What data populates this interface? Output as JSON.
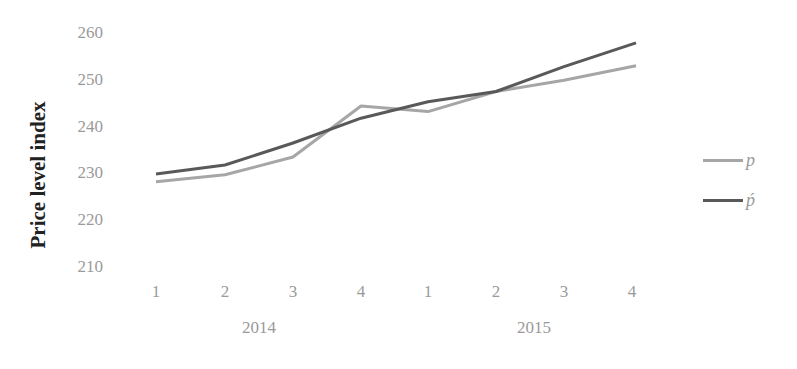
{
  "chart_data": {
    "type": "line",
    "title": "",
    "xlabel": "",
    "ylabel": "Price level index",
    "ylim": [
      210,
      260
    ],
    "yticks": [
      210,
      220,
      230,
      240,
      250,
      260
    ],
    "grid": false,
    "legend_position": "right",
    "categories": [
      "1",
      "2",
      "3",
      "4",
      "1",
      "2",
      "3",
      "4"
    ],
    "category_groups": [
      {
        "label": "2014",
        "quarters": [
          "1",
          "2",
          "3",
          "4"
        ]
      },
      {
        "label": "2015",
        "quarters": [
          "1",
          "2",
          "3",
          "4"
        ]
      }
    ],
    "series": [
      {
        "name": "p",
        "color": "#a6a6a6",
        "values": [
          228.2,
          229.7,
          233.5,
          244.4,
          243.2,
          247.5,
          249.9,
          253.0
        ]
      },
      {
        "name": "ṕ",
        "color": "#595959",
        "values": [
          229.9,
          231.8,
          236.5,
          241.8,
          245.3,
          247.5,
          252.8,
          257.9
        ]
      }
    ]
  },
  "axis": {
    "ylabel": "Price level index",
    "yticks": [
      "260",
      "250",
      "240",
      "230",
      "220",
      "210"
    ],
    "xticks": [
      "1",
      "2",
      "3",
      "4",
      "1",
      "2",
      "3",
      "4"
    ],
    "xgroups": [
      "2014",
      "2015"
    ]
  },
  "legend": [
    {
      "label": "p",
      "color": "#a6a6a6"
    },
    {
      "label": "ṕ",
      "color": "#595959"
    }
  ]
}
